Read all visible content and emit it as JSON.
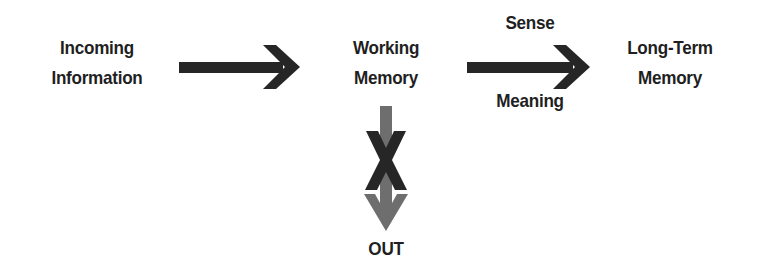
{
  "diagram": {
    "nodes": [
      {
        "id": "incoming",
        "lines": [
          "Incoming",
          "Information"
        ]
      },
      {
        "id": "working",
        "lines": [
          "Working",
          "Memory"
        ]
      },
      {
        "id": "longterm",
        "lines": [
          "Long-Term",
          "Memory"
        ]
      },
      {
        "id": "out",
        "lines": [
          "OUT"
        ]
      }
    ],
    "edges": [
      {
        "from": "incoming",
        "to": "working",
        "label_top": "",
        "label_bottom": ""
      },
      {
        "from": "working",
        "to": "longterm",
        "label_top": "Sense",
        "label_bottom": "Meaning"
      },
      {
        "from": "working",
        "to": "out",
        "blocked": true,
        "block_mark": "X"
      }
    ],
    "colors": {
      "text": "#1f1f1f",
      "arrow_dark": "#262626",
      "arrow_gray": "#6e6e6e",
      "background": "#ffffff"
    }
  }
}
